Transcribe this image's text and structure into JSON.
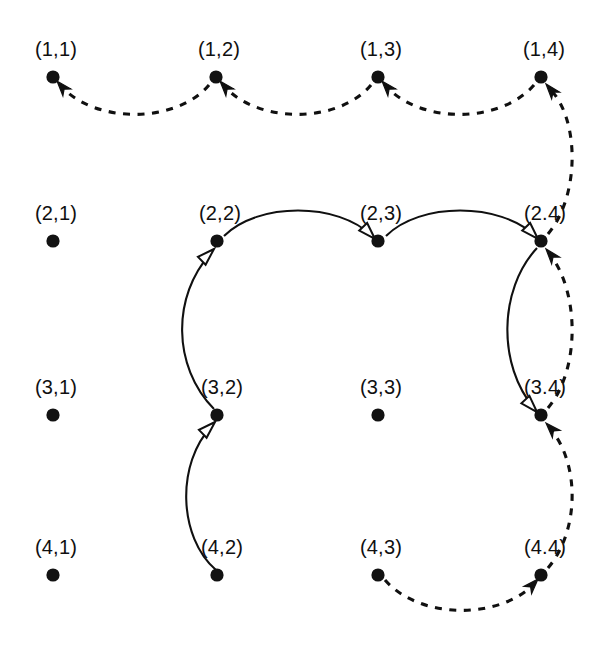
{
  "diagram": {
    "background_color": "#ffffff",
    "ink_color": "#101010",
    "node_radius": 6.6,
    "label_font_size": 20,
    "nodes": [
      {
        "id": "n11",
        "label": "(1,1)",
        "x": 53,
        "y": 77,
        "label_x": 56,
        "label_y": 56
      },
      {
        "id": "n12",
        "label": "(1,2)",
        "x": 216,
        "y": 77,
        "label_x": 219,
        "label_y": 56
      },
      {
        "id": "n13",
        "label": "(1,3)",
        "x": 378,
        "y": 77,
        "label_x": 381,
        "label_y": 56
      },
      {
        "id": "n14",
        "label": "(1,4)",
        "x": 541,
        "y": 77,
        "label_x": 544,
        "label_y": 56
      },
      {
        "id": "n21",
        "label": "(2,1)",
        "x": 53,
        "y": 241,
        "label_x": 56,
        "label_y": 220
      },
      {
        "id": "n22",
        "label": "(2,2)",
        "x": 217,
        "y": 241,
        "label_x": 220,
        "label_y": 220
      },
      {
        "id": "n23",
        "label": "(2,3)",
        "x": 378,
        "y": 241,
        "label_x": 381,
        "label_y": 220
      },
      {
        "id": "n24",
        "label": "(2.4)",
        "x": 541,
        "y": 241,
        "label_x": 545,
        "label_y": 220
      },
      {
        "id": "n31",
        "label": "(3,1)",
        "x": 53,
        "y": 415,
        "label_x": 56,
        "label_y": 394
      },
      {
        "id": "n32",
        "label": "(3,2)",
        "x": 217,
        "y": 415,
        "label_x": 222,
        "label_y": 394
      },
      {
        "id": "n33",
        "label": "(3,3)",
        "x": 378,
        "y": 415,
        "label_x": 381,
        "label_y": 394
      },
      {
        "id": "n34",
        "label": "(3.4)",
        "x": 541,
        "y": 415,
        "label_x": 545,
        "label_y": 394
      },
      {
        "id": "n41",
        "label": "(4,1)",
        "x": 53,
        "y": 575,
        "label_x": 56,
        "label_y": 554
      },
      {
        "id": "n42",
        "label": "(4,2)",
        "x": 217,
        "y": 575,
        "label_x": 222,
        "label_y": 554
      },
      {
        "id": "n43",
        "label": "(4,3)",
        "x": 378,
        "y": 575,
        "label_x": 381,
        "label_y": 554
      },
      {
        "id": "n44",
        "label": "(4.4)",
        "x": 541,
        "y": 575,
        "label_x": 545,
        "label_y": 554
      }
    ],
    "edges": [
      {
        "id": "e-14-13",
        "from": "(1,4)",
        "to": "(1,3)",
        "style": "dashed",
        "arrowhead": "filled",
        "path": "M 534 85 C 500 124 420 124 386 86",
        "arrow_tip_x": 382,
        "arrow_tip_y": 81,
        "arrow_angle": -131
      },
      {
        "id": "e-13-12",
        "from": "(1,3)",
        "to": "(1,2)",
        "style": "dashed",
        "arrowhead": "filled",
        "path": "M 371 85 C 338 124 258 124 224 86",
        "arrow_tip_x": 220,
        "arrow_tip_y": 81,
        "arrow_angle": -131
      },
      {
        "id": "e-12-11",
        "from": "(1,2)",
        "to": "(1,1)",
        "style": "dashed",
        "arrowhead": "filled",
        "path": "M 209 85 C 176 124 95 124 61 86",
        "arrow_tip_x": 57,
        "arrow_tip_y": 81,
        "arrow_angle": -131
      },
      {
        "id": "e-22-23",
        "from": "(2,2)",
        "to": "(2,3)",
        "style": "solid",
        "arrowhead": "open",
        "path": "M 224 236 C 258 202 338 202 372 236",
        "arrow_tip_x": 375,
        "arrow_tip_y": 239,
        "arrow_angle": 46
      },
      {
        "id": "e-23-24",
        "from": "(2,3)",
        "to": "(2,4)",
        "style": "solid",
        "arrowhead": "open",
        "path": "M 386 236 C 420 202 500 202 535 236",
        "arrow_tip_x": 538,
        "arrow_tip_y": 239,
        "arrow_angle": 46
      },
      {
        "id": "e-42-32",
        "from": "(4,2)",
        "to": "(3,2)",
        "style": "solid",
        "arrowhead": "open",
        "path": "M 216 570 C 178 537 176 463 212 426",
        "arrow_tip_x": 215,
        "arrow_tip_y": 422,
        "arrow_angle": -44
      },
      {
        "id": "e-32-22",
        "from": "(3,2)",
        "to": "(2,2)",
        "style": "solid",
        "arrowhead": "open",
        "path": "M 214 409 C 172 366 172 296 211 253",
        "arrow_tip_x": 214,
        "arrow_tip_y": 249,
        "arrow_angle": -44
      },
      {
        "id": "e-24-34",
        "from": "(2,4)",
        "to": "(3,4)",
        "style": "solid",
        "arrowhead": "open",
        "path": "M 537 248 C 498 290 498 366 534 408",
        "arrow_tip_x": 537,
        "arrow_tip_y": 412,
        "arrow_angle": 47
      },
      {
        "id": "e-43-44",
        "from": "(4,3)",
        "to": "(4,4)",
        "style": "dashed",
        "arrowhead": "filled",
        "path": "M 385 580 C 420 620 500 620 535 583",
        "arrow_tip_x": 538,
        "arrow_tip_y": 579,
        "arrow_angle": -47
      },
      {
        "id": "e-44-34",
        "from": "(4,4)",
        "to": "(3,4)",
        "style": "dashed",
        "arrowhead": "filled",
        "path": "M 548 568 C 580 530 580 462 549 427",
        "arrow_tip_x": 546,
        "arrow_tip_y": 423,
        "arrow_angle": -133
      },
      {
        "id": "e-34-24",
        "from": "(3,4)",
        "to": "(2,4)",
        "style": "dashed",
        "arrowhead": "filled",
        "path": "M 548 408 C 580 370 580 292 549 253",
        "arrow_tip_x": 546,
        "arrow_tip_y": 249,
        "arrow_angle": -130
      },
      {
        "id": "e-24-14",
        "from": "(2,4)",
        "to": "(1,4)",
        "style": "dashed",
        "arrowhead": "filled",
        "path": "M 548 234 C 580 196 580 118 549 88",
        "arrow_tip_x": 546,
        "arrow_tip_y": 84,
        "arrow_angle": -130
      }
    ],
    "legend": {
      "solid_edge_meaning": "solid curve with open arrowhead",
      "dashed_edge_meaning": "dashed curve with filled arrowhead"
    }
  }
}
